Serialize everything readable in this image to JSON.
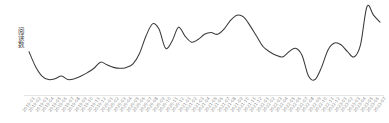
{
  "chart_data": {
    "type": "line",
    "title": "",
    "xlabel": "",
    "ylabel": "阅读数",
    "grid": false,
    "legend": null,
    "line_color": "#3a3a3a",
    "axis_color": "#e2e2e2",
    "background": "#ffffff",
    "ylim": [
      0,
      100
    ],
    "xlim": [
      0,
      54
    ],
    "categories": [
      "2019-01",
      "2019-02",
      "2019-03",
      "2019-04",
      "2019-05",
      "2019-06",
      "2019-07",
      "2019-08",
      "2019-09",
      "2019-10",
      "2019-11",
      "2019-12",
      "2020-01",
      "2020-02",
      "2020-03",
      "2020-04",
      "2020-05",
      "2020-06",
      "2020-07",
      "2020-08",
      "2020-09",
      "2020-10",
      "2020-11",
      "2020-12",
      "2021-01",
      "2021-02",
      "2021-03",
      "2021-04",
      "2021-05",
      "2021-06",
      "2021-07",
      "2021-08",
      "2021-09",
      "2021-10",
      "2021-11",
      "2021-12",
      "2022-01",
      "2022-02",
      "2022-03",
      "2022-04",
      "2022-05",
      "2022-06",
      "2022-07",
      "2022-08",
      "2022-09",
      "2022-10",
      "2022-11",
      "2022-12",
      "2023-01",
      "2023-02",
      "2023-03",
      "2023-04",
      "2023-05",
      "2023-06",
      "2023-07"
    ],
    "values": [
      44,
      27,
      16,
      12,
      13,
      16,
      12,
      13,
      16,
      20,
      25,
      32,
      29,
      26,
      25,
      26,
      30,
      42,
      62,
      76,
      70,
      48,
      56,
      72,
      62,
      55,
      58,
      64,
      66,
      64,
      70,
      80,
      86,
      84,
      74,
      62,
      50,
      44,
      40,
      38,
      44,
      48,
      40,
      16,
      12,
      26,
      46,
      54,
      52,
      44,
      38,
      52,
      96,
      86,
      78
    ],
    "smoothing": "monotone-spline"
  },
  "axis": {
    "y_label_text": "阅读数",
    "x_tick_rotation_deg": -52,
    "x_tick_count": 55
  }
}
